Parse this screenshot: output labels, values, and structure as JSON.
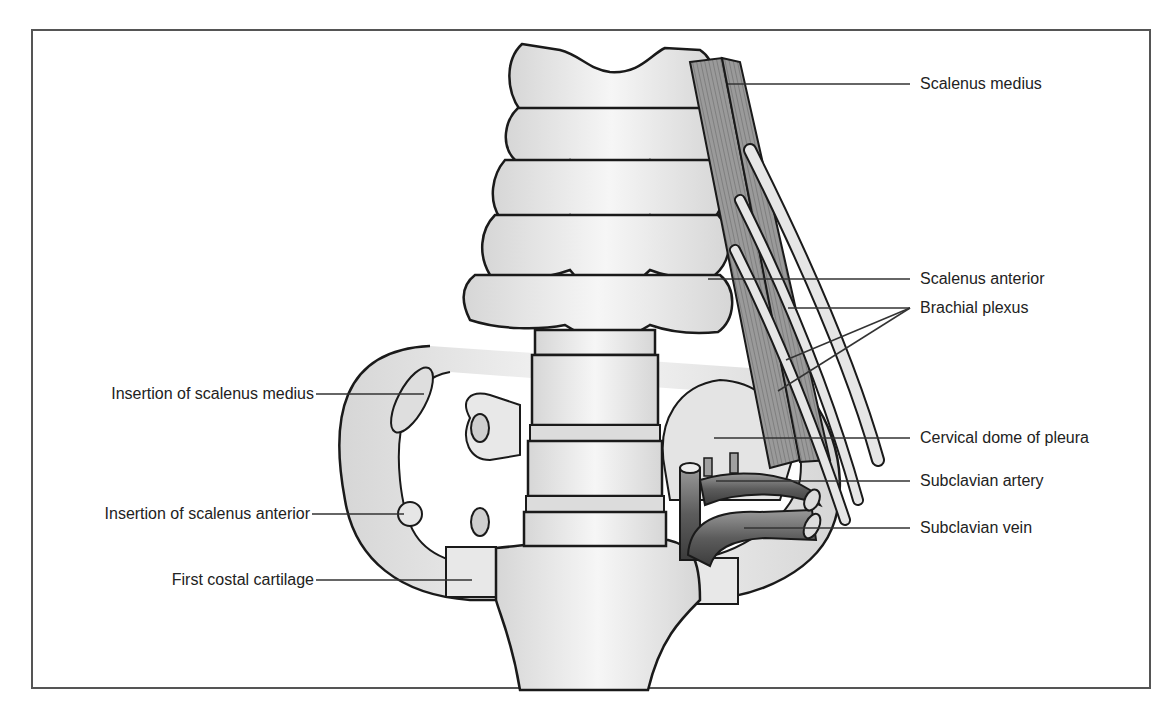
{
  "diagram": {
    "colors": {
      "frame": "#555555",
      "bone_fill": "#ececec",
      "bone_stroke": "#1a1a1a",
      "muscle": "#8a8a8a",
      "vessel": "#6e6e6e",
      "leader": "#333333"
    },
    "labels_right": [
      {
        "id": "scalenus-medius",
        "text": "Scalenus medius",
        "x": 920,
        "y": 84,
        "line": [
          [
            728,
            84
          ],
          [
            910,
            84
          ]
        ]
      },
      {
        "id": "scalenus-anterior",
        "text": "Scalenus anterior",
        "x": 920,
        "y": 275,
        "line": [
          [
            708,
            279
          ],
          [
            910,
            279
          ]
        ]
      },
      {
        "id": "brachial-plexus",
        "text": "Brachial plexus",
        "x": 920,
        "y": 302,
        "line": [
          [
            788,
            308
          ],
          [
            910,
            308
          ]
        ],
        "extra_lines": [
          [
            [
              786,
              360
            ],
            [
              910,
              308
            ]
          ],
          [
            [
              778,
              391
            ],
            [
              910,
              308
            ]
          ]
        ]
      },
      {
        "id": "cervical-dome-of-pleura",
        "text": "Cervical dome of pleura",
        "x": 920,
        "y": 429,
        "line": [
          [
            714,
            438
          ],
          [
            910,
            438
          ]
        ]
      },
      {
        "id": "subclavian-artery",
        "text": "Subclavian artery",
        "x": 920,
        "y": 471,
        "line": [
          [
            716,
            481
          ],
          [
            910,
            481
          ]
        ]
      },
      {
        "id": "subclavian-vein",
        "text": "Subclavian vein",
        "x": 920,
        "y": 521,
        "line": [
          [
            744,
            528
          ],
          [
            910,
            528
          ]
        ]
      }
    ],
    "labels_left": [
      {
        "id": "insertion-of-scalenus-medius",
        "text": "Insertion of scalenus medius",
        "right": 316,
        "y": 385,
        "line": [
          [
            316,
            394
          ],
          [
            424,
            394
          ]
        ]
      },
      {
        "id": "insertion-of-scalenus-anterior",
        "text": "Insertion of scalenus anterior",
        "right": 312,
        "y": 505,
        "line": [
          [
            312,
            514
          ],
          [
            404,
            514
          ]
        ]
      },
      {
        "id": "first-costal-cartilage",
        "text": "First costal cartilage",
        "right": 316,
        "y": 572,
        "line": [
          [
            316,
            580
          ],
          [
            472,
            580
          ]
        ]
      }
    ]
  }
}
